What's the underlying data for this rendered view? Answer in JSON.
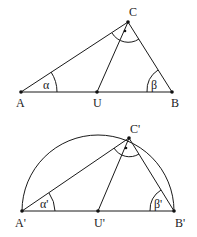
{
  "figures": [
    {
      "id": "triangle",
      "points": {
        "A": {
          "label": "A",
          "x": 21,
          "y": 92,
          "lx": 16,
          "ly": 107
        },
        "U": {
          "label": "U",
          "x": 97,
          "y": 92,
          "lx": 93,
          "ly": 107
        },
        "B": {
          "label": "B",
          "x": 172,
          "y": 92,
          "lx": 171,
          "ly": 107
        },
        "C": {
          "label": "C",
          "x": 128,
          "y": 22,
          "lx": 129,
          "ly": 16
        }
      },
      "angles": {
        "alpha": {
          "label": "α",
          "lx": 43,
          "ly": 89
        },
        "beta": {
          "label": "β",
          "lx": 151,
          "ly": 89
        }
      }
    },
    {
      "id": "semicircle-triangle",
      "points": {
        "A": {
          "label": "A'",
          "x": 22,
          "y": 211,
          "lx": 15,
          "ly": 227
        },
        "U": {
          "label": "U'",
          "x": 98,
          "y": 211,
          "lx": 94,
          "ly": 227
        },
        "B": {
          "label": "B'",
          "x": 174,
          "y": 211,
          "lx": 175,
          "ly": 227
        },
        "C": {
          "label": "C'",
          "x": 129,
          "y": 138,
          "lx": 130,
          "ly": 133
        }
      },
      "angles": {
        "alpha": {
          "label": "α'",
          "lx": 40,
          "ly": 208
        },
        "beta": {
          "label": "β'",
          "lx": 154,
          "ly": 208
        }
      },
      "semicircle_radius": 76
    }
  ]
}
